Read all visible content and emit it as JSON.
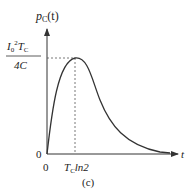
{
  "figure": {
    "caption": "(c)",
    "y_axis_label": "p",
    "y_axis_label_sub": "C",
    "y_axis_label_arg": "(t)",
    "x_axis_label": "t",
    "origin_x_label": "0",
    "origin_y_label": "0",
    "peak_value_numerator": "I",
    "peak_value_num_sub": "0",
    "peak_value_num_sup": "2",
    "peak_value_num_T": "T",
    "peak_value_num_T_sub": "C",
    "peak_value_denominator": "4C",
    "peak_time_T": "T",
    "peak_time_T_sub": "C",
    "peak_time_rest": "ln2",
    "stroke_color": "#333333",
    "dash_color": "#555555"
  }
}
